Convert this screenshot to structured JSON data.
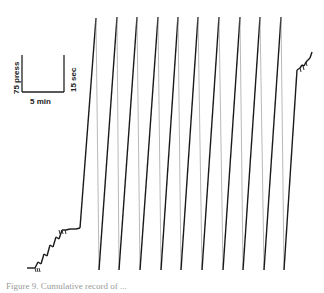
{
  "chart_data": {
    "type": "line",
    "title": "Cumulative record",
    "scale_bar": {
      "vertical_label": "75 press",
      "right_label": "15 sec",
      "horizontal_label": "5 min"
    },
    "xlabel": "",
    "ylabel": "",
    "grid": false,
    "legend": null,
    "series": [
      {
        "name": "cumulative responses",
        "points": [
          [
            27,
            268
          ],
          [
            35,
            268
          ],
          [
            38,
            262
          ],
          [
            41,
            264
          ],
          [
            44,
            254
          ],
          [
            47,
            256
          ],
          [
            50,
            245
          ],
          [
            53,
            247
          ],
          [
            56,
            237
          ],
          [
            59,
            239
          ],
          [
            62,
            230
          ],
          [
            66,
            230
          ],
          [
            70,
            229
          ],
          [
            76,
            229
          ],
          [
            80,
            228
          ],
          [
            96,
            18
          ],
          [
            99,
            270
          ],
          [
            117,
            17
          ],
          [
            119,
            270
          ],
          [
            137,
            17
          ],
          [
            140,
            270
          ],
          [
            158,
            17
          ],
          [
            161,
            270
          ],
          [
            178,
            17
          ],
          [
            181,
            270
          ],
          [
            198,
            17
          ],
          [
            202,
            270
          ],
          [
            219,
            17
          ],
          [
            223,
            270
          ],
          [
            240,
            17
          ],
          [
            243,
            270
          ],
          [
            260,
            17
          ],
          [
            264,
            270
          ],
          [
            281,
            17
          ],
          [
            284,
            270
          ],
          [
            297,
            70
          ],
          [
            300,
            68
          ],
          [
            302,
            65
          ],
          [
            304,
            66
          ],
          [
            306,
            62
          ],
          [
            308,
            60
          ],
          [
            310,
            58
          ],
          [
            312,
            52
          ]
        ]
      }
    ],
    "peaks_x": [
      96,
      117,
      137,
      158,
      178,
      198,
      219,
      240,
      260,
      281
    ],
    "troughs_x": [
      99,
      119,
      140,
      161,
      181,
      202,
      223,
      243,
      264,
      284
    ]
  },
  "caption": "Figure 9. Cumulative record of ..."
}
